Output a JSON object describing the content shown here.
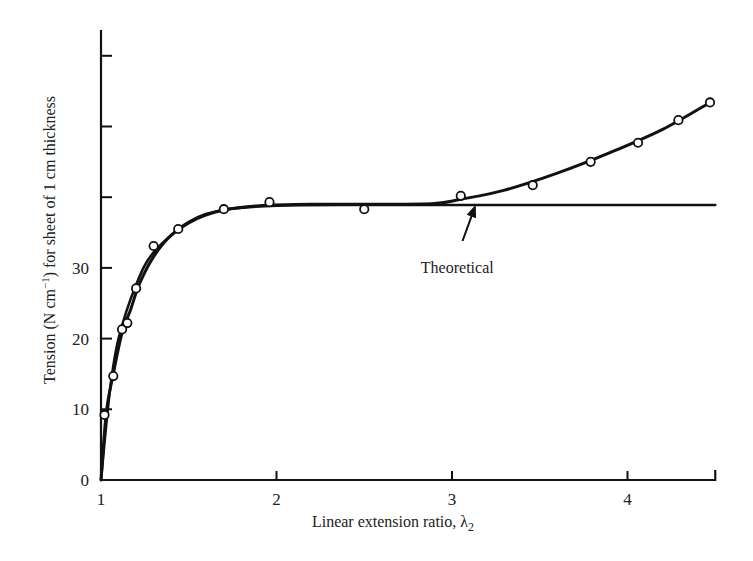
{
  "chart_data": {
    "type": "scatter",
    "title": "",
    "xlabel": "Linear extension ratio, λ",
    "xlabel_subscript": "2",
    "ylabel": "Tension (N cm",
    "ylabel_sup": "−1",
    "ylabel_rest": ") for sheet of 1 cm thickness",
    "xlim": [
      1,
      4.5
    ],
    "ylim": [
      0,
      60
    ],
    "grid": false,
    "x_ticks": [
      1,
      2,
      3,
      4
    ],
    "x_tick_labels": [
      "1",
      "2",
      "3",
      "4"
    ],
    "y_ticks": [
      0,
      10,
      20,
      30,
      40,
      50,
      60
    ],
    "y_tick_labels": [
      "0",
      "10",
      "20",
      "30",
      "",
      "",
      ""
    ],
    "series": [
      {
        "name": "Experimental",
        "style": "points-with-smooth-curve",
        "x": [
          1.02,
          1.07,
          1.12,
          1.15,
          1.2,
          1.3,
          1.44,
          1.7,
          1.96,
          2.5,
          3.05,
          3.46,
          3.79,
          4.06,
          4.29,
          4.47
        ],
        "y": [
          9.2,
          14.7,
          21.3,
          22.2,
          27.1,
          33.1,
          35.5,
          38.3,
          39.3,
          38.3,
          40.2,
          41.7,
          45.0,
          47.7,
          50.9,
          53.4
        ]
      },
      {
        "name": "Theoretical",
        "style": "line",
        "x": [
          1.0,
          1.05,
          1.1,
          1.2,
          1.3,
          1.5,
          1.7,
          2.0,
          2.5,
          3.0,
          3.5,
          4.0,
          4.5
        ],
        "y": [
          0,
          12.5,
          20.0,
          27.6,
          32.2,
          36.5,
          38.2,
          38.8,
          38.9,
          38.9,
          38.9,
          38.9,
          38.9
        ]
      }
    ],
    "experimental_curve": {
      "x": [
        1.0,
        1.03,
        1.07,
        1.12,
        1.17,
        1.22,
        1.3,
        1.4,
        1.55,
        1.7,
        1.9,
        2.2,
        2.6,
        2.9,
        3.05,
        3.3,
        3.6,
        3.9,
        4.2,
        4.47
      ],
      "y": [
        0,
        9.5,
        15.0,
        20.8,
        24.2,
        27.8,
        31.6,
        34.6,
        37.0,
        38.2,
        38.8,
        39.0,
        39.0,
        39.1,
        39.7,
        41.0,
        43.4,
        46.3,
        49.6,
        53.4
      ]
    },
    "annotations": [
      {
        "text": "Theoretical",
        "x": 3.03,
        "y": 32.8,
        "arrow_from": [
          3.06,
          33.8
        ],
        "arrow_to": [
          3.13,
          38.6
        ]
      }
    ],
    "legend": "none"
  }
}
